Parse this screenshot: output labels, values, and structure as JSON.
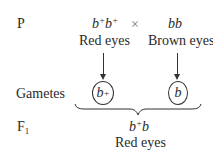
{
  "rows": {
    "p_label": "P",
    "gametes_label": "Gametes",
    "f1_label": "F",
    "f1_sub": "1"
  },
  "parents": {
    "left": {
      "genotype_base1": "b",
      "genotype_sup1": "+",
      "genotype_base2": "b",
      "genotype_sup2": "+",
      "phenotype": "Red eyes"
    },
    "cross_symbol": "×",
    "right": {
      "genotype": "bb",
      "phenotype": "Brown eyes"
    }
  },
  "gametes": {
    "left": {
      "base": "b",
      "sup": "+"
    },
    "right": {
      "base": "b"
    }
  },
  "f1": {
    "genotype_base1": "b",
    "genotype_sup": "+",
    "genotype_base2": "b",
    "phenotype": "Red eyes"
  }
}
